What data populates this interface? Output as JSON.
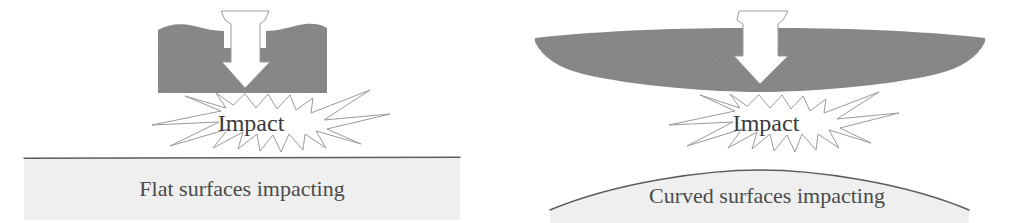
{
  "figure": {
    "background_color": "#ffffff"
  },
  "colors": {
    "block_gray": "#8c8c8c",
    "ground_fill": "#efefef",
    "ground_line": "#5d5d5d",
    "burst_stroke": "#9a9a9a",
    "arrow_fill": "#ffffff",
    "arrow_stroke": "#9b9b9b",
    "caption_text": "#4a4a4a",
    "impact_text": "#3a3a3a"
  },
  "panels": [
    {
      "id": "flat",
      "caption": "Flat surfaces impacting",
      "impact_label": "Impact",
      "upper_body": "flat-block",
      "lower_surface": "flat-ground",
      "arrow": "down-arrow"
    },
    {
      "id": "curved",
      "caption": "Curved surfaces impacting",
      "impact_label": "Impact",
      "upper_body": "curved-block",
      "lower_surface": "domed-ground",
      "arrow": "down-arrow"
    }
  ]
}
